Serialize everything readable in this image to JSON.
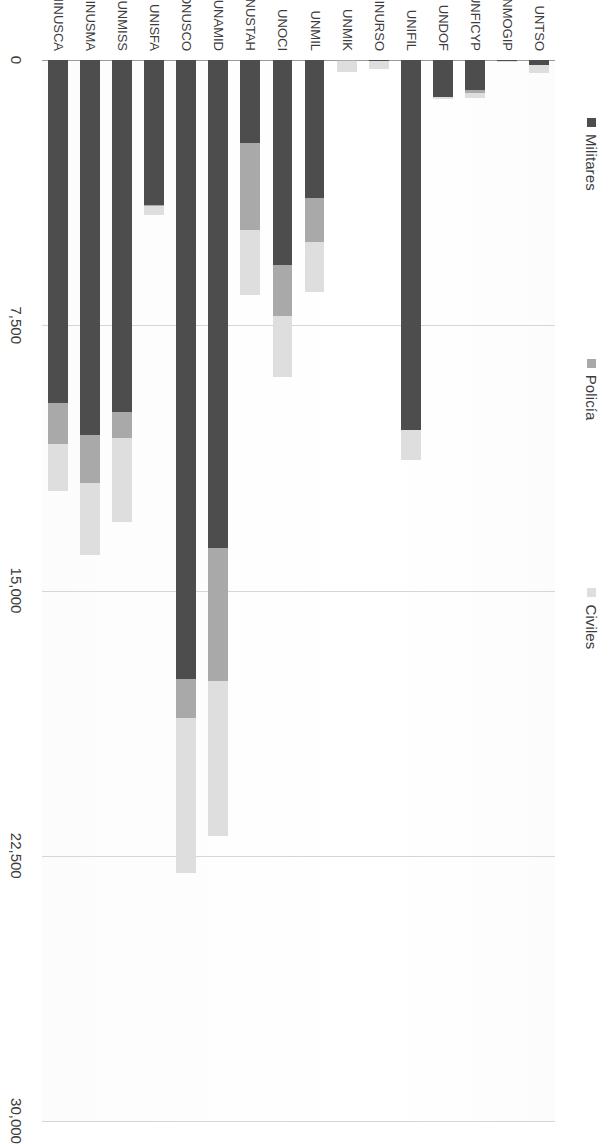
{
  "chart_data": {
    "type": "bar",
    "orientation": "horizontal",
    "rotated_degrees": 90,
    "title": "",
    "subtitle": "",
    "xlabel": "",
    "ylabel": "",
    "grid": true,
    "legend_position": "top",
    "axis_ticks": [
      "0",
      "7,500",
      "15,000",
      "22,500",
      "30,000"
    ],
    "axis_tick_values": [
      0,
      7500,
      15000,
      22500,
      30000
    ],
    "xlim": [
      0,
      30000
    ],
    "categories": [
      "UNTSO",
      "UNMOGIP",
      "UNFICYP",
      "UNDOF",
      "UNIFIL",
      "MINURSO",
      "UNMIK",
      "UNMIL",
      "UNOCI",
      "MINUSTAH",
      "UNAMID",
      "MONUSCO",
      "UNISFA",
      "UNMISS",
      "MINUSMA",
      "MINUSCA"
    ],
    "series": [
      {
        "name": "Militares",
        "color": "#4d4d4d",
        "values": [
          150,
          40,
          860,
          1050,
          10450,
          30,
          10,
          3900,
          5800,
          2350,
          13800,
          17500,
          4100,
          9950,
          10600,
          9700
        ]
      },
      {
        "name": "Policía",
        "color": "#a9a9a9",
        "values": [
          0,
          0,
          60,
          0,
          0,
          5,
          8,
          1250,
          1450,
          2450,
          3750,
          1100,
          20,
          750,
          1350,
          1150
        ]
      },
      {
        "name": "Civiles",
        "color": "#dedede",
        "values": [
          230,
          30,
          160,
          50,
          870,
          220,
          310,
          1400,
          1700,
          1850,
          4400,
          4400,
          250,
          2350,
          2050,
          1350
        ]
      }
    ]
  },
  "legend": {
    "items": [
      {
        "label": "Militares",
        "color": "#4d4d4d",
        "marker": "square-marker"
      },
      {
        "label": "Policía",
        "color": "#a9a9a9",
        "marker": "square-marker"
      },
      {
        "label": "Civiles",
        "color": "#dedede",
        "marker": "square-marker"
      }
    ]
  }
}
